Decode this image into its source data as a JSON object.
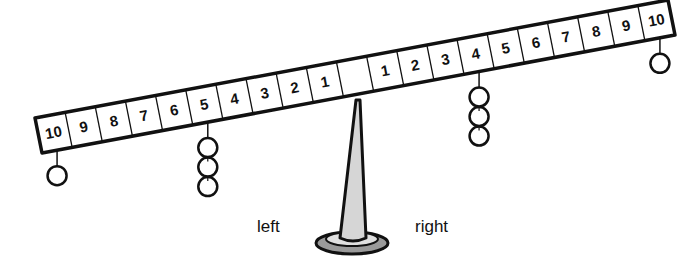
{
  "diagram": {
    "type": "balance-beam",
    "labels": {
      "left": "left",
      "right": "right"
    },
    "beam": {
      "left_positions": [
        "10",
        "9",
        "8",
        "7",
        "6",
        "5",
        "4",
        "3",
        "2",
        "1"
      ],
      "center": "",
      "right_positions": [
        "1",
        "2",
        "3",
        "4",
        "5",
        "6",
        "7",
        "8",
        "9",
        "10"
      ]
    },
    "weights": [
      {
        "side": "left",
        "position": 10,
        "count": 1
      },
      {
        "side": "left",
        "position": 5,
        "count": 3
      },
      {
        "side": "right",
        "position": 4,
        "count": 3
      },
      {
        "side": "right",
        "position": 10,
        "count": 1
      }
    ],
    "colors": {
      "stroke": "#111111",
      "fulcrum_fill": "#d6d6d6",
      "base_fill": "#9a9a9a",
      "beam_fill": "#ffffff"
    }
  }
}
